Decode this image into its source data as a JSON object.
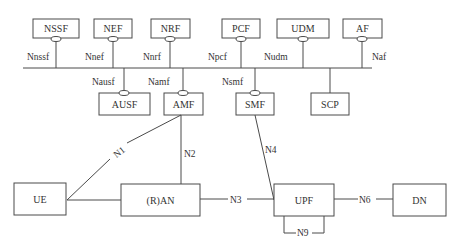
{
  "diagram": {
    "nodes": {
      "nssf": "NSSF",
      "nef": "NEF",
      "nrf": "NRF",
      "pcf": "PCF",
      "udm": "UDM",
      "af": "AF",
      "ausf": "AUSF",
      "amf": "AMF",
      "smf": "SMF",
      "scp": "SCP",
      "ue": "UE",
      "ran": "(R)AN",
      "upf": "UPF",
      "dn": "DN"
    },
    "service_interfaces": {
      "nssf": "Nnssf",
      "nef": "Nnef",
      "nrf": "Nnrf",
      "pcf": "Npcf",
      "udm": "Nudm",
      "af": "Naf",
      "ausf": "Nausf",
      "amf": "Namf",
      "smf": "Nsmf"
    },
    "reference_points": {
      "n1": "N1",
      "n2": "N2",
      "n3": "N3",
      "n4": "N4",
      "n6": "N6",
      "n9": "N9"
    },
    "colors": {
      "line": "#4a4a4a",
      "text": "#333333",
      "background": "#ffffff"
    }
  }
}
